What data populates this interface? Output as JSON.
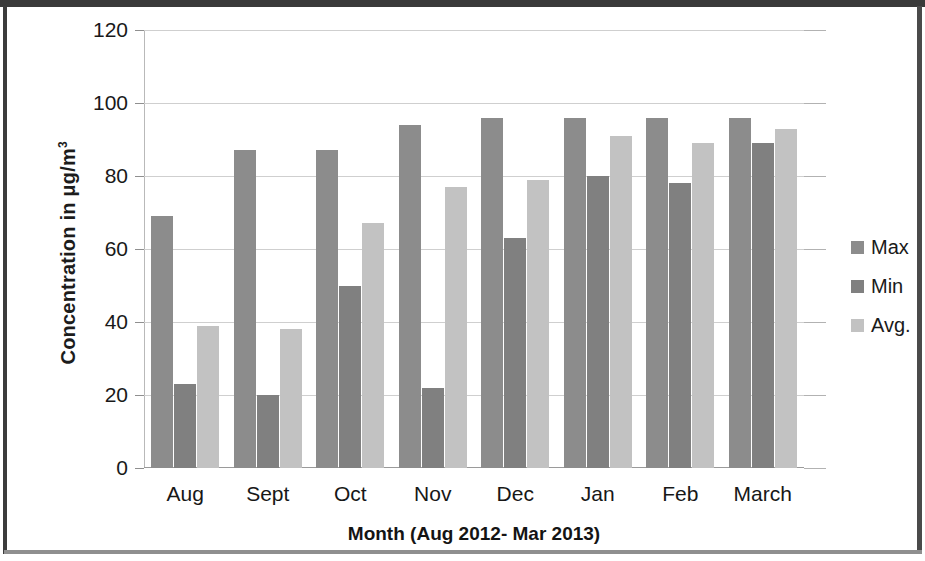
{
  "chart_data": {
    "type": "bar",
    "title": "",
    "xlabel": "Month (Aug 2012- Mar 2013)",
    "ylabel": "Concentration in μg/m³",
    "ylabel_main": "Concentration in μg/m",
    "ylabel_sup": "3",
    "categories": [
      "Aug",
      "Sept",
      "Oct",
      "Nov",
      "Dec",
      "Jan",
      "Feb",
      "March"
    ],
    "series": [
      {
        "name": "Max",
        "color": "#8c8c8c",
        "values": [
          69,
          87,
          87,
          94,
          96,
          96,
          96,
          96
        ]
      },
      {
        "name": "Min",
        "color": "#808080",
        "values": [
          23,
          20,
          50,
          22,
          63,
          80,
          78,
          89
        ]
      },
      {
        "name": "Avg.",
        "color": "#c2c2c2",
        "values": [
          39,
          38,
          67,
          77,
          79,
          91,
          89,
          93
        ]
      }
    ],
    "ylim": [
      0,
      120
    ],
    "ytick_values": [
      0,
      20,
      40,
      60,
      80,
      100,
      120
    ],
    "ytick_labels": [
      "0",
      "20",
      "40",
      "60",
      "80",
      "100",
      "120"
    ],
    "grid": true,
    "legend_position": "right",
    "legend_entries": [
      "Max",
      "Min",
      "Avg."
    ]
  }
}
